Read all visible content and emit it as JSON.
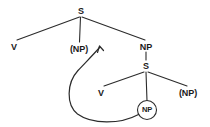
{
  "diagram": {
    "type": "syntax-tree",
    "background_color": "#ffffff",
    "line_color": "#2b2b2b",
    "text_color": "#1b1b1b",
    "nodes": [
      {
        "id": "s-root",
        "label": "S",
        "x": 81,
        "y": 11,
        "circled": false
      },
      {
        "id": "v-matrix",
        "label": "V",
        "x": 14,
        "y": 47,
        "circled": false
      },
      {
        "id": "np-trace-top",
        "label": "(NP)",
        "x": 79,
        "y": 49,
        "circled": false
      },
      {
        "id": "np-object",
        "label": "NP",
        "x": 146,
        "y": 47,
        "circled": false
      },
      {
        "id": "s-embedded",
        "label": "S",
        "x": 146,
        "y": 66,
        "circled": false
      },
      {
        "id": "v-embedded",
        "label": "V",
        "x": 101,
        "y": 93,
        "circled": false
      },
      {
        "id": "np-moved",
        "label": "NP",
        "x": 147,
        "y": 110,
        "circled": true
      },
      {
        "id": "np-trace-low",
        "label": "(NP)",
        "x": 188,
        "y": 93,
        "circled": false
      }
    ],
    "branches": [
      {
        "from": "s-root",
        "to": "v-matrix"
      },
      {
        "from": "s-root",
        "to": "np-trace-top"
      },
      {
        "from": "s-root",
        "to": "np-object"
      },
      {
        "from": "np-object",
        "to": "s-embedded"
      },
      {
        "from": "s-embedded",
        "to": "v-embedded"
      },
      {
        "from": "s-embedded",
        "to": "np-moved"
      },
      {
        "from": "s-embedded",
        "to": "np-trace-low"
      }
    ],
    "movement_arrow": {
      "from": "np-moved",
      "to": "np-trace-top",
      "direction": "up-left",
      "style": "curved-loop"
    }
  }
}
